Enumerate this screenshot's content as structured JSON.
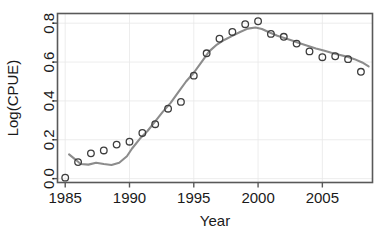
{
  "chart_data": {
    "type": "scatter",
    "title": "",
    "xlabel": "Year",
    "ylabel": "Log(CPUE)",
    "xlim": [
      1984.4,
      2008.9
    ],
    "ylim": [
      -0.02,
      0.85
    ],
    "grid": true,
    "legend": null,
    "xticks": [
      1985,
      1990,
      1995,
      2000,
      2005
    ],
    "xtick_labels": [
      "1985",
      "1990",
      "1995",
      "2000",
      "2005"
    ],
    "yticks": [
      0.0,
      0.2,
      0.4,
      0.6,
      0.8
    ],
    "ytick_labels": [
      "0.0",
      "0.2",
      "0.4",
      "0.6",
      "0.8"
    ],
    "series": [
      {
        "name": "observed",
        "marker": "open-circle",
        "color": "#3d3d3d",
        "x": [
          1985,
          1986,
          1987,
          1988,
          1989,
          1990,
          1991,
          1992,
          1993,
          1994,
          1995,
          1996,
          1997,
          1998,
          1999,
          2000,
          2001,
          2002,
          2003,
          2004,
          2005,
          2006,
          2007,
          2008
        ],
        "y": [
          0.005,
          0.085,
          0.13,
          0.145,
          0.175,
          0.19,
          0.235,
          0.28,
          0.36,
          0.395,
          0.53,
          0.645,
          0.72,
          0.755,
          0.795,
          0.81,
          0.745,
          0.73,
          0.695,
          0.655,
          0.625,
          0.63,
          0.615,
          0.55
        ]
      },
      {
        "name": "smoothed-trend",
        "marker": "none",
        "color": "#8c8c8c",
        "x": [
          1985.3,
          1985.8,
          1986.2,
          1986.8,
          1987.4,
          1988.0,
          1988.6,
          1989.2,
          1989.8,
          1990.2,
          1990.8,
          1991.4,
          1992.0,
          1992.6,
          1993.2,
          1993.8,
          1994.4,
          1995.0,
          1995.6,
          1996.2,
          1996.8,
          1997.4,
          1998.0,
          1998.6,
          1999.2,
          1999.8,
          2000.3,
          2000.9,
          2001.5,
          2002.1,
          2002.7,
          2003.3,
          2003.9,
          2004.5,
          2005.1,
          2005.7,
          2006.3,
          2006.9,
          2007.5,
          2008.1,
          2008.6
        ],
        "y": [
          0.125,
          0.098,
          0.075,
          0.072,
          0.082,
          0.075,
          0.07,
          0.082,
          0.115,
          0.155,
          0.205,
          0.245,
          0.295,
          0.345,
          0.39,
          0.445,
          0.5,
          0.545,
          0.6,
          0.655,
          0.69,
          0.715,
          0.735,
          0.755,
          0.772,
          0.778,
          0.77,
          0.752,
          0.735,
          0.722,
          0.71,
          0.695,
          0.683,
          0.67,
          0.66,
          0.648,
          0.638,
          0.628,
          0.615,
          0.598,
          0.578
        ]
      }
    ]
  },
  "axes": {
    "x_title": "Year",
    "y_title": "Log(CPUE)"
  }
}
